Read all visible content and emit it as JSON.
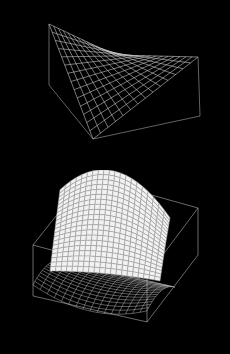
{
  "background": "#000000",
  "line_color": "#c8c8c8",
  "surface_fill": "#f2f2f2",
  "chart_data": [
    {
      "type": "surface",
      "render": "wireframe",
      "title": "",
      "xlabel": "",
      "ylabel": "",
      "zlabel": "",
      "function": "z = x*y (hyperbolic paraboloid, ruled surface)",
      "grid_divisions": 14,
      "box": true,
      "axes_ticks": false,
      "projection_px": {
        "corner_high_left": [
          49,
          24
        ],
        "corner_high_right": [
          198,
          57
        ],
        "corner_low_front": [
          93,
          139
        ],
        "corner_low_back": [
          115,
          55
        ],
        "box_left_bottom": [
          49,
          85
        ],
        "box_right_bottom": [
          200,
          116
        ]
      }
    },
    {
      "type": "surface",
      "render": "shaded mesh with wireframe base projection",
      "title": "",
      "xlabel": "",
      "ylabel": "",
      "zlabel": "",
      "function": "saddle-shaped surface (x^2 - y^2 like), shaded white, with grid projection on lower box face",
      "grid_divisions": 16,
      "box": true,
      "axes_ticks": false,
      "projection_px": {
        "box_top_back_left": [
          87,
          177
        ],
        "box_top_back_right": [
          198,
          208
        ],
        "box_top_front_left": [
          33,
          245
        ],
        "box_top_front_right": [
          147,
          276
        ],
        "box_bottom_front_left": [
          33,
          296
        ],
        "box_bottom_front_right": [
          147,
          322
        ],
        "box_bottom_back_right": [
          198,
          255
        ]
      }
    }
  ]
}
